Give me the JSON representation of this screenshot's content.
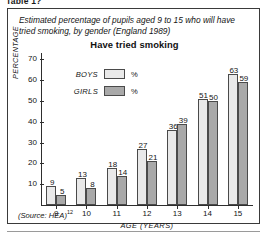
{
  "page": {
    "clipped_caption": "Table 1?"
  },
  "figure": {
    "title": "Estimated percentage of pupils aged 9 to 15 who will have tried smoking, by gender (England 1989)",
    "subtitle": "Have tried smoking",
    "source_label": "(Source: HEA)",
    "source_ref": "12"
  },
  "legend": {
    "boys": {
      "name": "BOYS",
      "unit": "%",
      "color": "#e9e9e9"
    },
    "girls": {
      "name": "GIRLS",
      "unit": "%",
      "color": "#a9a9a9"
    }
  },
  "chart_data": {
    "type": "bar",
    "title": "Have tried smoking",
    "subtitle": "Estimated percentage of pupils aged 9 to 15 who will have tried smoking, by gender (England 1989)",
    "xlabel": "AGE (YEARS)",
    "ylabel": "PERCENTAGE",
    "categories": [
      "9",
      "10",
      "11",
      "12",
      "13",
      "14",
      "15"
    ],
    "yticks": [
      10,
      20,
      30,
      40,
      50,
      60,
      70
    ],
    "ylim": [
      0,
      73
    ],
    "grid": false,
    "legend_position": "inside-top-left",
    "data_labels": true,
    "series": [
      {
        "name": "BOYS",
        "color": "#e9e9e9",
        "values": [
          9,
          13,
          18,
          27,
          36,
          51,
          63
        ]
      },
      {
        "name": "GIRLS",
        "color": "#a9a9a9",
        "values": [
          5,
          8,
          14,
          21,
          39,
          50,
          59
        ]
      }
    ],
    "annotations": [
      "(Source: HEA)12"
    ]
  }
}
